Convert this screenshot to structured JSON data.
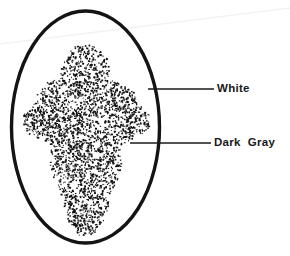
{
  "figure": {
    "background_color": "#ffffff",
    "ink_color": "#1a1a1a",
    "width": 290,
    "height": 256,
    "outline": {
      "name": "oval-outline",
      "shape": "ellipse",
      "cx": 85.5,
      "cy": 127,
      "rx": 74,
      "ry": 116,
      "stroke_width": 3.4,
      "stroke_color": "#141414"
    },
    "stipple": {
      "name": "stippled-region",
      "description": "dense dark gray stipple forming an insect-like bilaterally symmetric body with two upper lobes, wide lateral mid extensions and a broad rounded lower abdomen",
      "dot_color": "#111111",
      "seed": 20240117,
      "dot_count": 2600,
      "dot_min_size": 0.8,
      "dot_max_size": 2.1,
      "outline_points": "85.5,42 76,46 68,54 62,64 58,76 53,82 46,83 40,88 37,96 34,104 28,108 23,114 21,122 24,130 30,135 37,138 44,140 50,146 52,155 50,165 52,175 58,185 62,196 64,208 68,220 74,231 82,238 90,238 98,231 104,220 108,208 111,196 115,185 120,175 122,165 120,155 123,146 130,140 137,138 144,135 149,130 151,122 149,114 144,108 138,104 135,96 132,88 126,83 119,82 114,76 110,64 104,54 96,46"
    },
    "scan_artifact": {
      "name": "scan-line-artifact",
      "description": "very faint diagonal scanner streak across upper area",
      "color": "#f2f2f2",
      "x1": 0,
      "y1": 44,
      "x2": 290,
      "y2": 8
    }
  },
  "callouts": [
    {
      "name": "callout-white",
      "label": "White",
      "leader": {
        "x1": 148,
        "y1": 89,
        "x2": 214,
        "y2": 89,
        "stroke_width": 1.5
      },
      "label_x": 217,
      "label_y": 83
    },
    {
      "name": "callout-dark-gray",
      "label": "Dark  Gray",
      "leader": {
        "x1": 130,
        "y1": 143,
        "x2": 211,
        "y2": 143,
        "stroke_width": 1.5
      },
      "label_x": 214,
      "label_y": 137
    }
  ]
}
